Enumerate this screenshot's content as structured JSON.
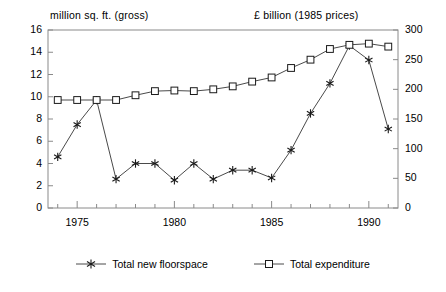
{
  "chart_data": {
    "type": "line",
    "title": "",
    "axis_titles": {
      "left": "million sq. ft. (gross)",
      "right": "£ billion (1985 prices)"
    },
    "xlabel": "",
    "x": [
      1974,
      1975,
      1976,
      1977,
      1978,
      1979,
      1980,
      1981,
      1982,
      1983,
      1984,
      1985,
      1986,
      1987,
      1988,
      1989,
      1990,
      1991
    ],
    "xlim": [
      1973.5,
      1991.5
    ],
    "x_ticks_all": [
      1974,
      1975,
      1976,
      1977,
      1978,
      1979,
      1980,
      1981,
      1982,
      1983,
      1984,
      1985,
      1986,
      1987,
      1988,
      1989,
      1990,
      1991
    ],
    "x_tick_labels": [
      "1975",
      "1980",
      "1985",
      "1990"
    ],
    "x_tick_label_values": [
      1975,
      1980,
      1985,
      1990
    ],
    "ylim_left": [
      0,
      16
    ],
    "y_ticks_left": [
      0,
      2,
      4,
      6,
      8,
      10,
      12,
      14,
      16
    ],
    "y_tick_labels_left": [
      "0",
      "2",
      "4",
      "6",
      "8",
      "10",
      "12",
      "14",
      "16"
    ],
    "ylim_right": [
      0,
      300
    ],
    "y_ticks_right": [
      0,
      50,
      100,
      150,
      200,
      250,
      300
    ],
    "y_tick_labels_right": [
      "0",
      "50",
      "100",
      "150",
      "200",
      "250",
      "300"
    ],
    "grid": false,
    "legend_position": "below",
    "series": [
      {
        "name": "Total new floorspace",
        "axis": "left",
        "marker": "asterisk",
        "units": "million sq. ft. (gross)",
        "values": [
          4.6,
          7.5,
          9.7,
          2.6,
          4.0,
          4.0,
          2.5,
          4.0,
          2.6,
          3.4,
          3.4,
          2.7,
          5.2,
          8.5,
          11.2,
          14.6,
          13.3,
          7.1
        ]
      },
      {
        "name": "Total expenditure",
        "axis": "right",
        "marker": "square",
        "units": "£ billion (1985 prices)",
        "values": [
          182,
          182,
          182,
          182,
          190,
          197,
          198,
          197,
          200,
          205,
          213,
          220,
          236,
          250,
          268,
          275,
          277,
          272
        ]
      }
    ]
  },
  "legend": {
    "items": [
      {
        "label": "Total new floorspace",
        "marker": "asterisk"
      },
      {
        "label": "Total expenditure",
        "marker": "square"
      }
    ]
  },
  "colors": {
    "line": "#4a4a4a",
    "axis": "#8a8a8a",
    "text": "#000000",
    "background": "#ffffff"
  }
}
